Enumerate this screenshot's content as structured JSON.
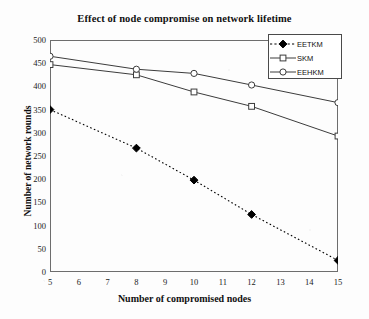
{
  "chart_data": {
    "type": "line",
    "title": "Effect of node compromise on network lifetime",
    "xlabel": "Number of compromised nodes",
    "ylabel": "Number of network rounds",
    "x": [
      5,
      8,
      10,
      12,
      15
    ],
    "xlim": [
      5,
      15
    ],
    "ylim": [
      0,
      500
    ],
    "xticks": [
      5,
      6,
      7,
      8,
      9,
      10,
      11,
      12,
      13,
      14,
      15
    ],
    "yticks": [
      0,
      50,
      100,
      150,
      200,
      250,
      300,
      350,
      400,
      450,
      500
    ],
    "grid": false,
    "legend_position": "top-right",
    "series": [
      {
        "name": "EETKM",
        "values": [
          350,
          267,
          198,
          124,
          25
        ],
        "line_style": "dashed",
        "marker": "diamond",
        "marker_fill": "#000000",
        "color": "#000000"
      },
      {
        "name": "SKM",
        "values": [
          447,
          425,
          388,
          357,
          293
        ],
        "line_style": "solid",
        "marker": "square",
        "marker_fill": "#ffffff",
        "color": "#3c3c3c"
      },
      {
        "name": "EEHKM",
        "values": [
          465,
          437,
          428,
          403,
          365
        ],
        "line_style": "solid",
        "marker": "circle",
        "marker_fill": "#ffffff",
        "color": "#3c3c3c"
      }
    ]
  },
  "legend": {
    "items": [
      {
        "label": "EETKM"
      },
      {
        "label": "SKM"
      },
      {
        "label": "EEHKM"
      }
    ]
  },
  "colors": {
    "axis": "#6d6d6d",
    "text": "#111111",
    "background": "#fdfdfd"
  }
}
